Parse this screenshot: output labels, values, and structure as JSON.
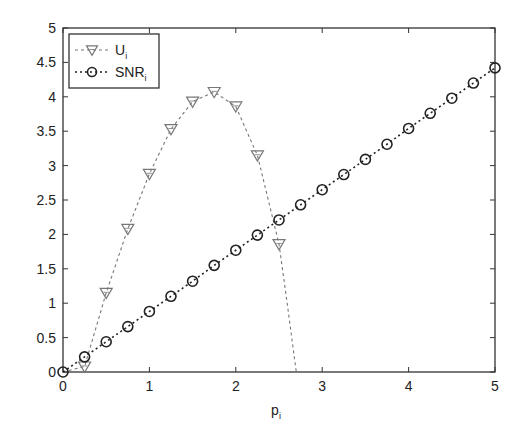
{
  "chart_data": {
    "type": "line",
    "title": "",
    "xlabel": "p",
    "xlabel_sub": "i",
    "ylabel": "",
    "xlim": [
      0,
      5
    ],
    "ylim": [
      0,
      5
    ],
    "grid": false,
    "legend_position": "upper-left",
    "xticks": [
      "0",
      "1",
      "2",
      "3",
      "4",
      "5"
    ],
    "yticks": [
      "0",
      "0.5",
      "1",
      "1.5",
      "2",
      "2.5",
      "3",
      "3.5",
      "4",
      "4.5",
      "5"
    ],
    "series": [
      {
        "name": "U",
        "name_sub": "i",
        "marker": "triangle-down",
        "line_style": "dashed",
        "color": "#777777",
        "x": [
          0,
          0.25,
          0.5,
          0.75,
          1.0,
          1.25,
          1.5,
          1.75,
          2.0,
          2.25,
          2.5
        ],
        "values": [
          0,
          0.08,
          1.15,
          2.08,
          2.88,
          3.53,
          3.93,
          4.07,
          3.86,
          3.15,
          1.86
        ],
        "line_extension": {
          "x": [
            2.5,
            2.6,
            2.7
          ],
          "values": [
            1.86,
            0.95,
            0.0
          ]
        }
      },
      {
        "name": "SNR",
        "name_sub": "i",
        "marker": "circle",
        "line_style": "dotted",
        "color": "#222222",
        "x": [
          0,
          0.25,
          0.5,
          0.75,
          1.0,
          1.25,
          1.5,
          1.75,
          2.0,
          2.25,
          2.5,
          2.75,
          3.0,
          3.25,
          3.5,
          3.75,
          4.0,
          4.25,
          4.5,
          4.75,
          5.0
        ],
        "values": [
          0,
          0.22,
          0.44,
          0.66,
          0.88,
          1.1,
          1.32,
          1.55,
          1.77,
          1.99,
          2.21,
          2.43,
          2.65,
          2.87,
          3.09,
          3.31,
          3.54,
          3.76,
          3.98,
          4.2,
          4.42
        ]
      }
    ]
  }
}
